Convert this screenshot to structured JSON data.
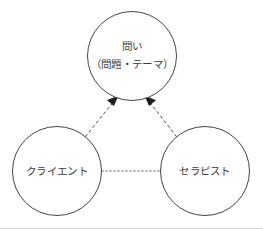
{
  "figure": {
    "width": 263,
    "height": 233,
    "background_color": "#ffffff",
    "type": "triangle-relationship-diagram"
  },
  "nodes": [
    {
      "id": "question",
      "name": "question-node",
      "cx": 132,
      "cy": 56,
      "r": 44.5,
      "lines": [
        "問い",
        "（問題・テーマ）"
      ],
      "line1": "問い",
      "line2": "（問題・テーマ）",
      "stroke_color": "#454545",
      "fill_color": "#ffffff"
    },
    {
      "id": "client",
      "name": "client-node",
      "cx": 57,
      "cy": 171,
      "r": 44.5,
      "lines": [
        "クライエント"
      ],
      "line1": "クライエント",
      "stroke_color": "#454545",
      "fill_color": "#ffffff"
    },
    {
      "id": "therapist",
      "name": "therapist-node",
      "cx": 205,
      "cy": 171,
      "r": 44.5,
      "lines": [
        "セラピスト"
      ],
      "line1": "セラピスト",
      "stroke_color": "#454545",
      "fill_color": "#ffffff"
    }
  ],
  "edges": [
    {
      "id": "client-to-question",
      "name": "client-to-question-arrow",
      "from": "client",
      "to": "question",
      "style": "dashed",
      "arrowhead": "filled-triangle",
      "direction": "one-way",
      "color": "#4a4a4a"
    },
    {
      "id": "therapist-to-question",
      "name": "therapist-to-question-arrow",
      "from": "therapist",
      "to": "question",
      "style": "dashed",
      "arrowhead": "filled-triangle",
      "direction": "one-way",
      "color": "#4a4a4a"
    },
    {
      "id": "client-therapist",
      "name": "client-therapist-connector",
      "from": "client",
      "to": "therapist",
      "style": "dashed",
      "arrowhead": "none",
      "direction": "none",
      "color": "#585858"
    }
  ],
  "rule": {
    "name": "bottom-rule",
    "color": "#d8d8d8",
    "y": 228.5
  }
}
